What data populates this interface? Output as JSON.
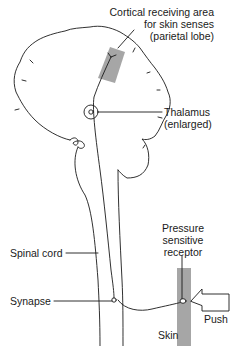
{
  "diagram": {
    "labels": {
      "cortical_line1": "Cortical receiving area",
      "cortical_line2": "for skin senses",
      "cortical_line3": "(parietal lobe)",
      "thalamus_line1": "Thalamus",
      "thalamus_line2": "(enlarged)",
      "pressure_line1": "Pressure",
      "pressure_line2": "sensitive",
      "pressure_line3": "receptor",
      "spinal_cord": "Spinal cord",
      "synapse": "Synapse",
      "skin": "Skin",
      "push": "Push"
    },
    "colors": {
      "line": "#1a1a1a",
      "shaded_region": "#a6a6a6",
      "background": "#ffffff"
    }
  }
}
